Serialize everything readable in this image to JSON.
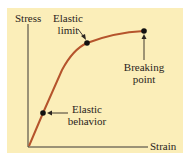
{
  "diagram": {
    "axes": {
      "y_label": "Stress",
      "x_label": "Strain"
    },
    "annotations": {
      "elastic_limit": [
        "Elastic",
        "limit"
      ],
      "breaking_point": [
        "Breaking",
        "point"
      ],
      "elastic_behavior": [
        "Elastic",
        "behavior"
      ]
    },
    "colors": {
      "background": "#fbeeb9",
      "curve": "#b5542c",
      "axis": "#3a3632",
      "marker": "#111111"
    }
  }
}
